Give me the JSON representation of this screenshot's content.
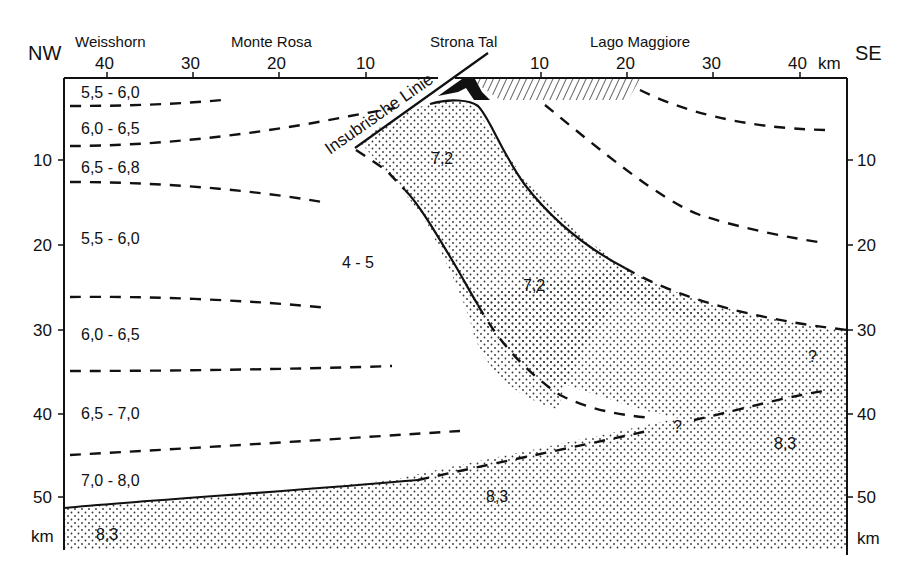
{
  "diagram": {
    "type": "geological-cross-section",
    "orientation": {
      "left": "NW",
      "right": "SE"
    },
    "places": [
      "Weisshorn",
      "Monte Rosa",
      "Strona Tal",
      "Lago Maggiore"
    ],
    "top_axis": {
      "left_ticks": [
        "40",
        "30",
        "20",
        "10"
      ],
      "right_ticks": [
        "10",
        "20",
        "30",
        "40"
      ],
      "unit": "km"
    },
    "depth_axis": {
      "left_ticks": [
        "10",
        "20",
        "30",
        "40",
        "50"
      ],
      "right_ticks": [
        "10",
        "20",
        "30",
        "40",
        "50"
      ],
      "unit": "km"
    },
    "fault_label": "Insubrische Linie",
    "velocity_labels": {
      "nw_layer_1": "5,5 - 6,0",
      "nw_layer_2": "6,0 - 6,5",
      "nw_layer_3": "6,5 - 6,8",
      "nw_layer_4": "5,5 - 6,0",
      "nw_layer_5": "6,0 - 6,5",
      "nw_layer_6": "6,5 - 7,0",
      "nw_layer_7": "7,0 - 8,0",
      "mantle_nw": "8,3",
      "mantle_center": "8,3",
      "mantle_se": "8,3",
      "ivrea_body_upper": "7,2",
      "ivrea_body_lower": "7,2",
      "low_velocity_zone": "4 - 5",
      "uncertain_1": "?",
      "uncertain_2": "?"
    }
  }
}
